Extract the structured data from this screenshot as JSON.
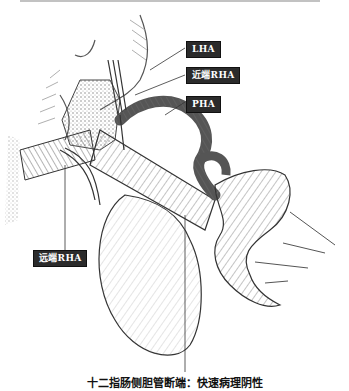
{
  "figure": {
    "type": "surgical anatomical illustration",
    "labels": {
      "lha": "LHA",
      "proximal_rha": "近端RHA",
      "pha": "PHA",
      "distal_rha": "远端RHA"
    },
    "caption": "十二指肠侧胆管断端：快速病理阴性",
    "colors": {
      "label_bg": "#2b2b2b",
      "label_text": "#ffffff",
      "line": "#333333",
      "hatch": "#7a7a7a"
    }
  }
}
